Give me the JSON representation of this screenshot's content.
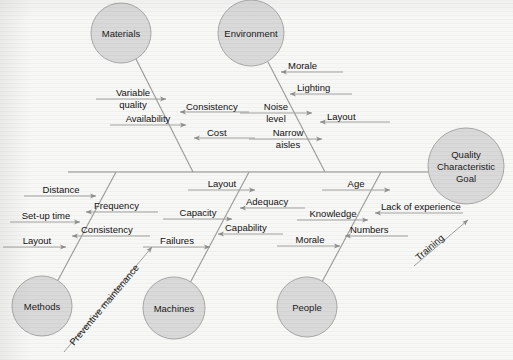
{
  "diagram": {
    "type": "fishbone-ishikawa",
    "title_node": {
      "name": "quality-characteristic-goal",
      "lines": [
        "Quality",
        "Characteristic",
        "Goal"
      ],
      "cx": 466,
      "cy": 166,
      "r": 38
    },
    "colors": {
      "background": "#f7f7f5",
      "node_fill": "#d9d9d9",
      "node_stroke": "#a8a8a8",
      "line": "#9a9a9a",
      "text": "#121212"
    },
    "spine": {
      "x1": 68,
      "y1": 172,
      "x2": 430,
      "y2": 172
    },
    "categories": [
      {
        "id": "materials",
        "label": "Materials",
        "position": "top",
        "cx": 121,
        "cy": 33,
        "r": 30,
        "bone": {
          "x1": 136,
          "y1": 59,
          "x2": 193,
          "y2": 172
        },
        "causes": [
          {
            "label": "Variable quality",
            "lines": [
              "Variable",
              "quality"
            ],
            "side": "left"
          },
          {
            "label": "Consistency",
            "lines": [
              "Consistency"
            ],
            "side": "right"
          },
          {
            "label": "Availability",
            "lines": [
              "Availability"
            ],
            "side": "left"
          },
          {
            "label": "Cost",
            "lines": [
              "Cost"
            ],
            "side": "right"
          }
        ]
      },
      {
        "id": "environment",
        "label": "Environment",
        "position": "top",
        "cx": 251,
        "cy": 33,
        "r": 33,
        "bone": {
          "x1": 266,
          "y1": 62,
          "x2": 323,
          "y2": 172
        },
        "causes": [
          {
            "label": "Morale",
            "lines": [
              "Morale"
            ],
            "side": "right"
          },
          {
            "label": "Lighting",
            "lines": [
              "Lighting"
            ],
            "side": "right"
          },
          {
            "label": "Noise level",
            "lines": [
              "Noise",
              "level"
            ],
            "side": "left"
          },
          {
            "label": "Layout",
            "lines": [
              "Layout"
            ],
            "side": "right"
          },
          {
            "label": "Narrow aisles",
            "lines": [
              "Narrow",
              "aisles"
            ],
            "side": "left"
          }
        ]
      },
      {
        "id": "methods",
        "label": "Methods",
        "position": "bottom",
        "cx": 42,
        "cy": 306,
        "r": 30,
        "bone": {
          "x1": 57,
          "y1": 280,
          "x2": 114,
          "y2": 172
        },
        "causes": [
          {
            "label": "Distance",
            "lines": [
              "Distance"
            ],
            "side": "left"
          },
          {
            "label": "Frequency",
            "lines": [
              "Frequency"
            ],
            "side": "right"
          },
          {
            "label": "Set-up time",
            "lines": [
              "Set-up time"
            ],
            "side": "left"
          },
          {
            "label": "Consistency",
            "lines": [
              "Consistency"
            ],
            "side": "right"
          },
          {
            "label": "Layout",
            "lines": [
              "Layout"
            ],
            "side": "left"
          }
        ]
      },
      {
        "id": "machines",
        "label": "Machines",
        "position": "bottom",
        "cx": 174,
        "cy": 308,
        "r": 31,
        "bone": {
          "x1": 189,
          "y1": 281,
          "x2": 246,
          "y2": 172
        },
        "causes": [
          {
            "label": "Layout",
            "lines": [
              "Layout"
            ],
            "side": "left"
          },
          {
            "label": "Adequacy",
            "lines": [
              "Adequacy"
            ],
            "side": "right"
          },
          {
            "label": "Capacity",
            "lines": [
              "Capacity"
            ],
            "side": "left"
          },
          {
            "label": "Capability",
            "lines": [
              "Capability"
            ],
            "side": "right"
          },
          {
            "label": "Failures",
            "lines": [
              "Failures"
            ],
            "side": "left"
          }
        ]
      },
      {
        "id": "people",
        "label": "People",
        "position": "bottom",
        "cx": 307,
        "cy": 307,
        "r": 30,
        "bone": {
          "x1": 322,
          "y1": 281,
          "x2": 379,
          "y2": 172
        },
        "causes": [
          {
            "label": "Age",
            "lines": [
              "Age"
            ],
            "side": "left"
          },
          {
            "label": "Lack of experience",
            "lines": [
              "Lack of experience"
            ],
            "side": "right"
          },
          {
            "label": "Knowledge",
            "lines": [
              "Knowledge"
            ],
            "side": "left"
          },
          {
            "label": "Numbers",
            "lines": [
              "Numbers"
            ],
            "side": "right"
          },
          {
            "label": "Morale",
            "lines": [
              "Morale"
            ],
            "side": "left"
          }
        ]
      }
    ],
    "diagonal_causes": [
      {
        "id": "preventive-maintenance",
        "label": "Preventive maintenance",
        "x1": 64,
        "y1": 352,
        "x2": 150,
        "y2": 248
      },
      {
        "id": "training",
        "label": "Training",
        "x1": 414,
        "y1": 266,
        "x2": 467,
        "y2": 221
      }
    ],
    "cause_text": {
      "materials_variable_quality_l1": "Variable",
      "materials_variable_quality_l2": "quality",
      "materials_consistency": "Consistency",
      "materials_availability": "Availability",
      "materials_cost": "Cost",
      "environment_morale": "Morale",
      "environment_lighting": "Lighting",
      "environment_noise_l1": "Noise",
      "environment_noise_l2": "level",
      "environment_layout": "Layout",
      "environment_narrow_l1": "Narrow",
      "environment_narrow_l2": "aisles",
      "methods_distance": "Distance",
      "methods_frequency": "Frequency",
      "methods_setup_time": "Set-up time",
      "methods_consistency": "Consistency",
      "methods_layout": "Layout",
      "machines_layout": "Layout",
      "machines_adequacy": "Adequacy",
      "machines_capacity": "Capacity",
      "machines_capability": "Capability",
      "machines_failures": "Failures",
      "people_age": "Age",
      "people_lack_of_experience": "Lack of experience",
      "people_knowledge": "Knowledge",
      "people_numbers": "Numbers",
      "people_morale": "Morale",
      "diagonal_preventive_maintenance": "Preventive maintenance",
      "diagonal_training": "Training"
    },
    "node_text": {
      "materials": "Materials",
      "environment": "Environment",
      "methods": "Methods",
      "machines": "Machines",
      "people": "People",
      "goal_l1": "Quality",
      "goal_l2": "Characteristic",
      "goal_l3": "Goal"
    }
  }
}
